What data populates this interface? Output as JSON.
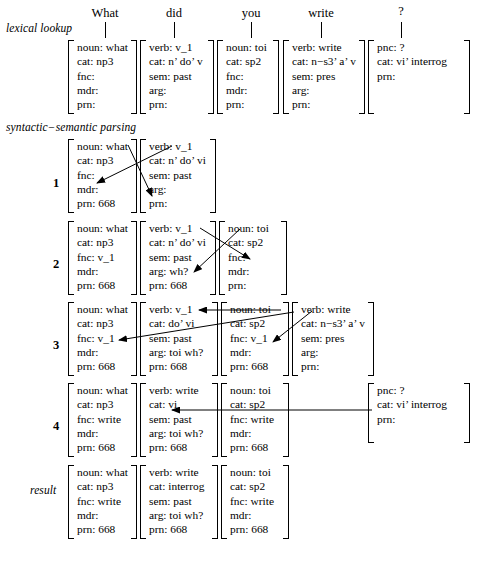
{
  "diagram": {
    "title_words": [
      "What",
      "did",
      "you",
      "write",
      "?"
    ],
    "stage_labels": {
      "lexical": "lexical lookup",
      "parsing": "syntactic−semantic parsing",
      "result": "result"
    },
    "row_numbers": [
      "1",
      "2",
      "3",
      "4"
    ]
  },
  "lexical_lookup": [
    {
      "lines": [
        "noun: what",
        "cat: np3",
        "fnc:",
        "mdr:",
        "prn:"
      ]
    },
    {
      "lines": [
        "verb: v_1",
        "cat: n’ do’ v",
        "sem: past",
        "arg:",
        "prn:"
      ]
    },
    {
      "lines": [
        "noun: toi",
        "cat: sp2",
        "fnc:",
        "mdr:",
        "prn:"
      ]
    },
    {
      "lines": [
        "verb: write",
        "cat: n−s3’ a’ v",
        "sem: pres",
        "arg:",
        "prn:"
      ]
    },
    {
      "lines": [
        "pnc: ?",
        "cat: vi’ interrog",
        "prn:"
      ]
    }
  ],
  "parsing_rows": [
    {
      "number": "1",
      "blocks": [
        {
          "lines": [
            "noun: what",
            "cat: np3",
            "fnc:",
            "mdr:",
            "prn: 668"
          ]
        },
        {
          "lines": [
            "verb: v_1",
            "cat: n’ do’ vi",
            "sem: past",
            "arg:",
            "prn:"
          ]
        }
      ]
    },
    {
      "number": "2",
      "blocks": [
        {
          "lines": [
            "noun: what",
            "cat: np3",
            "fnc: v_1",
            "mdr:",
            "prn: 668"
          ]
        },
        {
          "lines": [
            "verb: v_1",
            "cat: n’ do’ vi",
            "sem: past",
            "arg: wh?",
            "prn: 668"
          ]
        },
        {
          "lines": [
            "noun: toi",
            "cat: sp2",
            "fnc:",
            "mdr:",
            "prn:"
          ]
        }
      ]
    },
    {
      "number": "3",
      "blocks": [
        {
          "lines": [
            "noun: what",
            "cat: np3",
            "fnc: v_1",
            "mdr:",
            "prn: 668"
          ]
        },
        {
          "lines": [
            "verb: v_1",
            "cat: do’ vi",
            "sem: past",
            "arg: toi wh?",
            "prn: 668"
          ]
        },
        {
          "lines": [
            "noun: toi",
            "cat: sp2",
            "fnc: v_1",
            "mdr:",
            "prn: 668"
          ]
        },
        {
          "lines": [
            "verb: write",
            "cat: n−s3’ a’ v",
            "sem: pres",
            "arg:",
            "prn:"
          ]
        }
      ]
    },
    {
      "number": "4",
      "blocks": [
        {
          "lines": [
            "noun: what",
            "cat: np3",
            "fnc: write",
            "mdr:",
            "prn: 668"
          ]
        },
        {
          "lines": [
            "verb: write",
            "cat: vi",
            "sem: past",
            "arg: toi wh?",
            "prn: 668"
          ]
        },
        {
          "lines": [
            "noun: toi",
            "cat: sp2",
            "fnc: write",
            "mdr:",
            "prn: 668"
          ]
        },
        {
          "lines": [
            "pnc: ?",
            "cat: vi’ interrog",
            "prn:"
          ]
        }
      ]
    }
  ],
  "result_row": {
    "blocks": [
      {
        "lines": [
          "noun: what",
          "cat: np3",
          "fnc: write",
          "mdr:",
          "prn: 668"
        ]
      },
      {
        "lines": [
          "verb: write",
          "cat: interrog",
          "sem: past",
          "arg: toi wh?",
          "prn: 668"
        ]
      },
      {
        "lines": [
          "noun: toi",
          "cat: sp2",
          "fnc: write",
          "mdr:",
          "prn: 668"
        ]
      }
    ]
  },
  "colors": {
    "ink": "#000000",
    "paper": "#ffffff"
  }
}
